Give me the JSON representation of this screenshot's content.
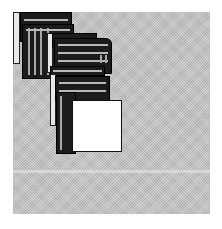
{
  "scene": {
    "description": "Dithered monochrome illustration of a cascading trail of overlapping windows on a gray desktop",
    "colors": {
      "background": "#ffffff",
      "desktop": "#c4c4c4",
      "window_dark": "#1c1c1c",
      "window_highlight": "#b8b8b8",
      "front_window": "#ffffff"
    },
    "windows": [
      {
        "name": "window-1",
        "x": 13,
        "y": 12,
        "w": 60,
        "h": 50
      },
      {
        "name": "window-2",
        "x": 20,
        "y": 18,
        "w": 55,
        "h": 60
      },
      {
        "name": "window-3",
        "x": 48,
        "y": 33,
        "w": 62,
        "h": 45
      },
      {
        "name": "window-4",
        "x": 52,
        "y": 50,
        "w": 60,
        "h": 40
      },
      {
        "name": "window-5",
        "x": 55,
        "y": 75,
        "w": 55,
        "h": 45
      },
      {
        "name": "window-6",
        "x": 58,
        "y": 95,
        "w": 40,
        "h": 57
      },
      {
        "name": "front-window",
        "x": 72,
        "y": 100,
        "w": 50,
        "h": 52
      }
    ]
  }
}
